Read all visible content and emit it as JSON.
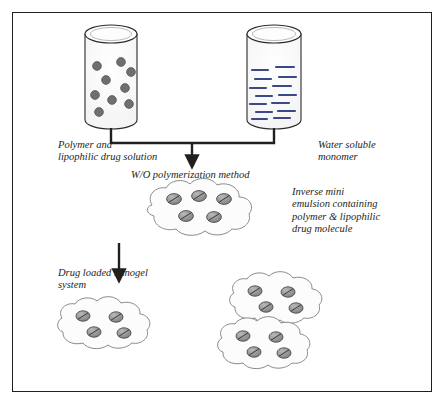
{
  "diagram": {
    "background_color": "#ffffff",
    "border_color": "#231f20",
    "labels": {
      "polymer_solution": "Polymer and\nlipophilic drug solution",
      "water_soluble_monomer": "Water soluble\nmonomer",
      "method": "W/O polymerization method",
      "inverse_emulsion": "Inverse mini\nemulsion containing\npolymer & lipophilic\ndrug molecule",
      "drug_loaded_nanogel": "Drug loaded nanogel\nsystem"
    },
    "beakers": [
      {
        "name": "polymer-beaker",
        "content_type": "dots",
        "dot_count": 9,
        "dot_color": "#6b6b6b",
        "outline_color": "#2a2a2a",
        "fill_color": "#fbfbfb"
      },
      {
        "name": "monomer-beaker",
        "content_type": "dashes",
        "dash_count": 14,
        "dash_color": "#3a4a86",
        "outline_color": "#2a2a2a",
        "fill_color": "#fbfbfb"
      }
    ],
    "connectors": {
      "merge_line_color": "#231f20",
      "arrow_color": "#231f20",
      "arrow_count": 2
    },
    "nanogels": [
      {
        "name": "emulsion-cloud-main",
        "particle_count": 5
      },
      {
        "name": "nanogel-cloud-1",
        "particle_count": 4
      },
      {
        "name": "nanogel-cloud-2",
        "particle_count": 4
      },
      {
        "name": "nanogel-cloud-3",
        "particle_count": 4
      }
    ],
    "particle": {
      "fill_color": "#8f8f8f",
      "stroke_color": "#4a4a4a",
      "cloud_fill": "#fcfcfc",
      "cloud_stroke": "#7a7a7a"
    }
  }
}
